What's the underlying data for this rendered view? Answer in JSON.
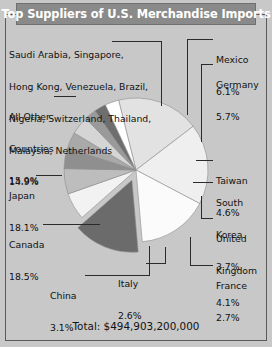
{
  "header": {
    "title": "Top Suppliers of U.S. Merchandise Imports"
  },
  "footer": {
    "total_label": "Total: $494,903,200,000"
  },
  "colors": {
    "title_band": "#8a8a8a",
    "title_text": "#ffffff",
    "background": "#c8c8c8",
    "frame": "#5a5a5a",
    "leader": "#2b2b2b"
  },
  "chart_data": {
    "type": "pie",
    "title": "Top Suppliers of U.S. Merchandise Imports",
    "total": "$494,903,200,000",
    "units": "percent of total U.S. merchandise imports",
    "legend": "none",
    "grid": false,
    "labels": [
      "Canada",
      "Japan",
      "All Other Countries",
      "Saudi Arabia, Singapore, Hong Kong, Venezuela, Brazil, Nigeria, Switzerland, Thailand, Malaysia, Netherlands",
      "Mexico",
      "Germany",
      "Taiwan",
      "South Korea",
      "United Kingdom",
      "France",
      "Italy",
      "China"
    ],
    "values": [
      18.5,
      18.1,
      15.9,
      14.9,
      6.1,
      5.7,
      4.6,
      3.7,
      4.1,
      2.7,
      2.6,
      3.1
    ],
    "slices": [
      {
        "name": "Canada",
        "value": 18.5,
        "pct": "18.5%",
        "color": "#e2e2e2",
        "exploded": false
      },
      {
        "name": "Japan",
        "value": 18.1,
        "pct": "18.1%",
        "color": "#efefef",
        "exploded": false
      },
      {
        "name": "All Other Countries",
        "value": 15.9,
        "pct": "15.9%",
        "color": "#fbfbfb",
        "exploded": false
      },
      {
        "name": "Saudi Arabia group",
        "value": 14.9,
        "pct": "14.9%",
        "color": "#6b6b6b",
        "exploded": true
      },
      {
        "name": "Mexico",
        "value": 6.1,
        "pct": "6.1%",
        "color": "#f2f2f2",
        "exploded": false
      },
      {
        "name": "Germany",
        "value": 5.7,
        "pct": "5.7%",
        "color": "#bdbdbd",
        "exploded": false
      },
      {
        "name": "Taiwan",
        "value": 4.6,
        "pct": "4.6%",
        "color": "#8f8f8f",
        "exploded": false
      },
      {
        "name": "South Korea",
        "value": 3.7,
        "pct": "3.7%",
        "color": "#a9a9a9",
        "exploded": false
      },
      {
        "name": "United Kingdom",
        "value": 4.1,
        "pct": "4.1%",
        "color": "#d5d5d5",
        "exploded": false
      },
      {
        "name": "France",
        "value": 2.7,
        "pct": "2.7%",
        "color": "#9a9a9a",
        "exploded": false
      },
      {
        "name": "Italy",
        "value": 2.6,
        "pct": "2.6%",
        "color": "#6e6e6e",
        "exploded": false
      },
      {
        "name": "China",
        "value": 3.1,
        "pct": "3.1%",
        "color": "#ffffff",
        "exploded": false
      }
    ]
  },
  "callouts": {
    "group": {
      "line1": "Saudi Arabia, Singapore,",
      "line2": "Hong Kong, Venezuela, Brazil,",
      "line3": "Nigeria, Switzerland, Thailand,",
      "line4": "Malaysia, Netherlands",
      "pct": "14.9%"
    },
    "all_other": {
      "line1": "All Other",
      "line2": "Countries",
      "pct": "15.9%"
    },
    "japan": {
      "name": "Japan",
      "pct": "18.1%"
    },
    "canada": {
      "name": "Canada",
      "pct": "18.5%"
    },
    "china": {
      "name": "China",
      "pct": "3.1%"
    },
    "italy": {
      "name": "Italy",
      "pct": "2.6%"
    },
    "mexico": {
      "name": "Mexico",
      "pct": "6.1%"
    },
    "germany": {
      "name": "Germany",
      "pct": "5.7%"
    },
    "taiwan": {
      "name": "Taiwan",
      "pct": "4.6%"
    },
    "south_korea": {
      "line1": "South",
      "line2": "Korea",
      "pct": "3.7%"
    },
    "united_kingdom": {
      "line1": "United",
      "line2": "Kingdom",
      "pct": "4.1%"
    },
    "france": {
      "name": "France",
      "pct": "2.7%"
    }
  }
}
